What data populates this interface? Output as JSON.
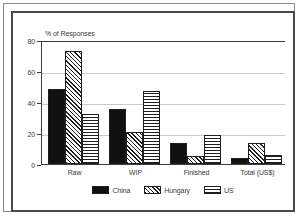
{
  "chart_data": {
    "type": "bar",
    "title": "",
    "subtitle": "",
    "axis_title": "% of Responses",
    "xlabel": "",
    "ylabel": "% of Responses",
    "categories": [
      "Raw",
      "WIP",
      "Finished",
      "Total (US$)"
    ],
    "series": [
      {
        "name": "China",
        "values": [
          49,
          36,
          14,
          4
        ],
        "fill": "solid",
        "color": "#111111"
      },
      {
        "name": "Hungary",
        "values": [
          74,
          21,
          5,
          14
        ],
        "fill": "diagonal",
        "color": "#1e1e1e"
      },
      {
        "name": "US",
        "values": [
          33,
          48,
          19,
          6
        ],
        "fill": "crosshatch",
        "color": "#1e1e1e"
      }
    ],
    "ylim": [
      0,
      80
    ],
    "yticks": [
      0,
      20,
      40,
      60,
      80
    ],
    "ytick_labels": [
      "0",
      "20",
      "40",
      "60",
      "80"
    ],
    "grid": true,
    "grid_axis": "y",
    "legend_position": "bottom",
    "legend_entries": [
      "China",
      "Hungary",
      "US"
    ]
  },
  "figure": {
    "border_color": "#8a8a8a",
    "inner_border_color": "#4a4a4a",
    "background": "#ffffff",
    "axis_color": "#3c3c3c",
    "grid_color": "#c9c9c9",
    "text_color": "#3a3a3a"
  }
}
